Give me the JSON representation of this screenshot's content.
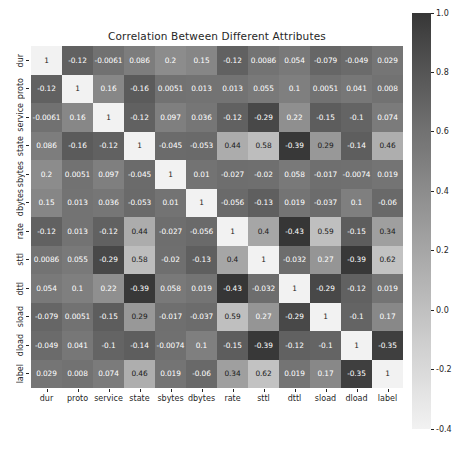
{
  "chart_data": {
    "type": "heatmap",
    "title": "Correlation Between Different Attributes",
    "xlabel": "",
    "ylabel": "",
    "grid": false,
    "legend_position": "right",
    "colorbar": {
      "orientation": "vertical",
      "vmin": -0.4,
      "vmax": 1.0,
      "colormap": "grayscale",
      "low_color": "#3a3a3a",
      "high_color": "#f0f0f0",
      "ticks": [
        1.0,
        0.8,
        0.6,
        0.4,
        0.2,
        0.0,
        -0.2,
        -0.4
      ],
      "tick_labels": [
        "1.0",
        "0.8",
        "0.6",
        "0.4",
        "0.2",
        "0.0",
        "-0.2",
        "-0.4"
      ]
    },
    "categories": [
      "dur",
      "proto",
      "service",
      "state",
      "sbytes",
      "dbytes",
      "rate",
      "sttl",
      "dttl",
      "sload",
      "dload",
      "label"
    ],
    "x_tick_labels": [
      "dur",
      "proto",
      "service",
      "state",
      "sbytes",
      "dbytes",
      "rate",
      "sttl",
      "dttl",
      "sload",
      "dload",
      "label"
    ],
    "y_tick_labels": [
      "dur",
      "proto",
      "service",
      "state",
      "sbytes",
      "dbytes",
      "rate",
      "sttl",
      "dttl",
      "sload",
      "dload",
      "label"
    ],
    "values": [
      [
        1,
        -0.12,
        -0.0061,
        0.086,
        0.2,
        0.15,
        -0.12,
        0.0086,
        0.054,
        -0.079,
        -0.049,
        0.029
      ],
      [
        -0.12,
        1,
        0.16,
        -0.16,
        0.0051,
        0.013,
        0.013,
        0.055,
        0.1,
        0.0051,
        0.041,
        0.008
      ],
      [
        -0.0061,
        0.16,
        1,
        -0.12,
        0.097,
        0.036,
        -0.12,
        -0.29,
        0.22,
        -0.15,
        -0.1,
        0.074
      ],
      [
        0.086,
        -0.16,
        -0.12,
        1,
        -0.045,
        -0.053,
        0.44,
        0.58,
        -0.39,
        0.29,
        -0.14,
        0.46
      ],
      [
        0.2,
        0.0051,
        0.097,
        -0.045,
        1,
        0.01,
        -0.027,
        -0.02,
        0.058,
        -0.017,
        -0.0074,
        0.019
      ],
      [
        0.15,
        0.013,
        0.036,
        -0.053,
        0.01,
        1,
        -0.056,
        -0.13,
        0.019,
        -0.037,
        0.1,
        -0.06
      ],
      [
        -0.12,
        0.013,
        -0.12,
        0.44,
        -0.027,
        -0.056,
        1,
        0.4,
        -0.43,
        0.59,
        -0.15,
        0.34
      ],
      [
        0.0086,
        0.055,
        -0.29,
        0.58,
        -0.02,
        -0.13,
        0.4,
        1,
        -0.032,
        0.27,
        -0.39,
        0.62
      ],
      [
        0.054,
        0.1,
        0.22,
        -0.39,
        0.058,
        0.019,
        -0.43,
        -0.032,
        1,
        -0.29,
        -0.12,
        0.019
      ],
      [
        -0.079,
        0.0051,
        -0.15,
        0.29,
        -0.017,
        -0.037,
        0.59,
        0.27,
        -0.29,
        1,
        -0.1,
        0.17
      ],
      [
        -0.049,
        0.041,
        -0.1,
        -0.14,
        -0.0074,
        0.1,
        -0.15,
        -0.39,
        -0.12,
        -0.1,
        1,
        -0.35
      ],
      [
        0.029,
        0.008,
        0.074,
        0.46,
        0.019,
        -0.06,
        0.34,
        0.62,
        0.019,
        0.17,
        -0.35,
        1
      ]
    ],
    "annotations": [
      [
        "1",
        "-0.12",
        "-0.0061",
        "0.086",
        "0.2",
        "0.15",
        "-0.12",
        "0.0086",
        "0.054",
        "-0.079",
        "-0.049",
        "0.029"
      ],
      [
        "-0.12",
        "1",
        "0.16",
        "-0.16",
        "0.0051",
        "0.013",
        "0.013",
        "0.055",
        "0.1",
        "0.0051",
        "0.041",
        "0.008"
      ],
      [
        "-0.0061",
        "0.16",
        "1",
        "-0.12",
        "0.097",
        "0.036",
        "-0.12",
        "-0.29",
        "0.22",
        "-0.15",
        "-0.1",
        "0.074"
      ],
      [
        "0.086",
        "-0.16",
        "-0.12",
        "1",
        "-0.045",
        "-0.053",
        "0.44",
        "0.58",
        "-0.39",
        "0.29",
        "-0.14",
        "0.46"
      ],
      [
        "0.2",
        "0.0051",
        "0.097",
        "-0.045",
        "1",
        "0.01",
        "-0.027",
        "-0.02",
        "0.058",
        "-0.017",
        "-0.0074",
        "0.019"
      ],
      [
        "0.15",
        "0.013",
        "0.036",
        "-0.053",
        "0.01",
        "1",
        "-0.056",
        "-0.13",
        "0.019",
        "-0.037",
        "0.1",
        "-0.06"
      ],
      [
        "-0.12",
        "0.013",
        "-0.12",
        "0.44",
        "-0.027",
        "-0.056",
        "1",
        "0.4",
        "-0.43",
        "0.59",
        "-0.15",
        "0.34"
      ],
      [
        "0.0086",
        "0.055",
        "-0.29",
        "0.58",
        "-0.02",
        "-0.13",
        "0.4",
        "1",
        "-0.032",
        "0.27",
        "-0.39",
        "0.62"
      ],
      [
        "0.054",
        "0.1",
        "0.22",
        "-0.39",
        "0.058",
        "0.019",
        "-0.43",
        "-0.032",
        "1",
        "-0.29",
        "-0.12",
        "0.019"
      ],
      [
        "-0.079",
        "0.0051",
        "-0.15",
        "0.29",
        "-0.017",
        "-0.037",
        "0.59",
        "0.27",
        "-0.29",
        "1",
        "-0.1",
        "0.17"
      ],
      [
        "-0.049",
        "0.041",
        "-0.1",
        "-0.14",
        "-0.0074",
        "0.1",
        "-0.15",
        "-0.39",
        "-0.12",
        "-0.1",
        "1",
        "-0.35"
      ],
      [
        "0.029",
        "0.008",
        "0.074",
        "0.46",
        "0.019",
        "-0.06",
        "0.34",
        "0.62",
        "0.019",
        "0.17",
        "-0.35",
        "1"
      ]
    ]
  }
}
